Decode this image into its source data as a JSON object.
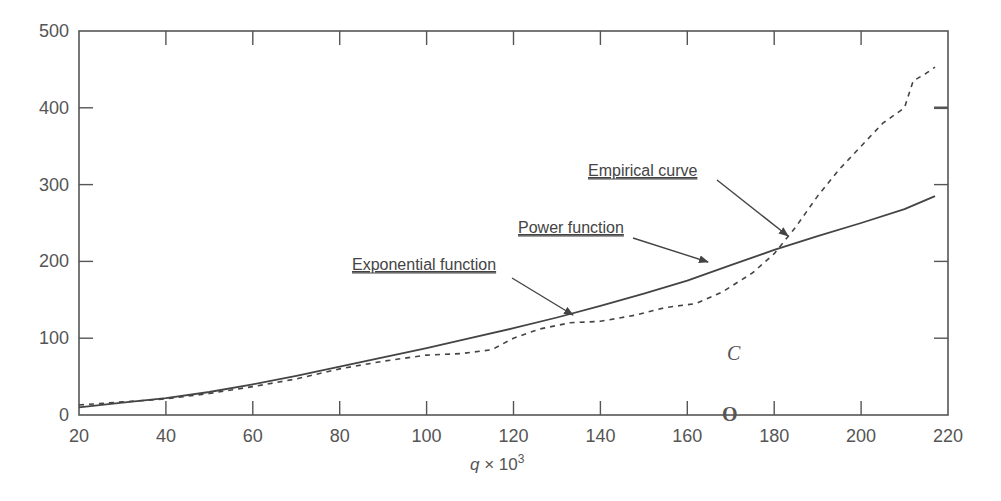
{
  "chart_data": {
    "type": "line",
    "title": "",
    "xlabel": "q × 10³",
    "xlabel_parts": {
      "var": "q",
      "times": " × 10",
      "exp": "3"
    },
    "ylabel": "",
    "xlim": [
      20,
      220
    ],
    "ylim": [
      0,
      500
    ],
    "xticks": [
      20,
      40,
      60,
      80,
      100,
      120,
      140,
      160,
      180,
      200,
      220
    ],
    "yticks": [
      0,
      100,
      200,
      300,
      400,
      500
    ],
    "grid": false,
    "legend": "none (annotations with arrows)",
    "series": [
      {
        "name": "Power / Exponential function (fitted)",
        "style": "solid",
        "x": [
          20,
          30,
          40,
          50,
          60,
          70,
          80,
          90,
          100,
          110,
          120,
          130,
          140,
          150,
          160,
          170,
          180,
          190,
          200,
          210,
          217
        ],
        "y": [
          10,
          16,
          22,
          30,
          40,
          51,
          63,
          75,
          87,
          100,
          113,
          127,
          142,
          158,
          175,
          195,
          215,
          233,
          250,
          268,
          285
        ]
      },
      {
        "name": "Empirical curve",
        "style": "dashed",
        "x": [
          20,
          30,
          40,
          50,
          60,
          70,
          80,
          90,
          100,
          108,
          115,
          120,
          126,
          133,
          140,
          148,
          155,
          162,
          168,
          175,
          180,
          185,
          190,
          195,
          200,
          205,
          210,
          212,
          215,
          217
        ],
        "y": [
          13,
          17,
          21,
          28,
          37,
          47,
          60,
          70,
          78,
          80,
          85,
          100,
          112,
          120,
          122,
          130,
          140,
          145,
          160,
          185,
          210,
          245,
          285,
          320,
          350,
          380,
          400,
          435,
          445,
          453
        ]
      }
    ],
    "annotations": [
      {
        "text": "Exponential function",
        "label_x": 352,
        "label_y": 270,
        "arrow_from": [
          512,
          278
        ],
        "arrow_to": [
          573,
          315
        ]
      },
      {
        "text": "Power function",
        "label_x": 518,
        "label_y": 233,
        "arrow_from": [
          633,
          238
        ],
        "arrow_to": [
          708,
          262
        ]
      },
      {
        "text": "Empirical curve",
        "label_x": 588,
        "label_y": 176,
        "arrow_from": [
          717,
          180
        ],
        "arrow_to": [
          788,
          236
        ]
      }
    ],
    "marks": [
      {
        "text": "C",
        "x": 727,
        "y": 360,
        "style": "italic"
      },
      {
        "text": "O",
        "x": 722,
        "y": 421,
        "style": "bold"
      }
    ]
  }
}
